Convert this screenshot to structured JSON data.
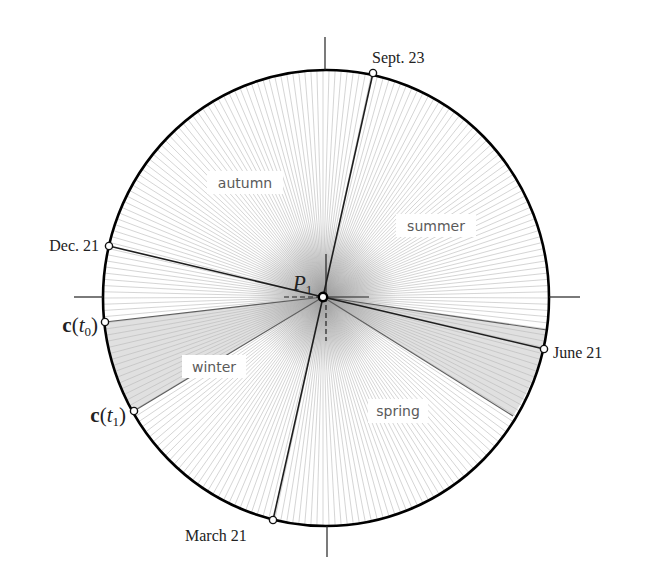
{
  "diagram": {
    "center": {
      "name": "P",
      "sub": "1"
    },
    "dates": {
      "sept": "Sept. 23",
      "dec": "Dec. 21",
      "june": "June 21",
      "march": "March 21"
    },
    "curve_points": [
      {
        "vector": "c",
        "open": "(",
        "param": "t",
        "sub": "0",
        "close": ")"
      },
      {
        "vector": "c",
        "open": "(",
        "param": "t",
        "sub": "1",
        "close": ")"
      }
    ],
    "seasons": {
      "autumn": "autumn",
      "summer": "summer",
      "winter": "winter",
      "spring": "spring"
    }
  }
}
